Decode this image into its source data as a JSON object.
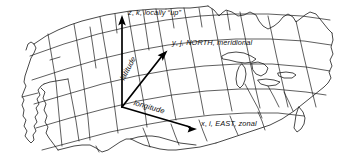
{
  "figure": {
    "background_color": "#ffffff",
    "line_color": "#1a1a1a",
    "axis_color": "#000000",
    "width": 343,
    "height": 162
  },
  "map": {
    "name": "continental-united-states",
    "projection": "oblique perspective",
    "features": [
      "state-boundaries",
      "coastline",
      "great-lakes",
      "graticule"
    ]
  },
  "axes": {
    "origin": {
      "x": 122,
      "y": 107
    },
    "items": [
      {
        "name": "z-axis",
        "label_parts": {
          "symbol": "z",
          "unit_vector": "k",
          "rest": ", locally “up”"
        },
        "full_label": "z, k, locally “up”",
        "tip": {
          "x": 122,
          "y": 17
        }
      },
      {
        "name": "y-axis",
        "label_parts": {
          "symbol": "y",
          "unit_vector": "j",
          "rest": ", NORTH, meridional"
        },
        "full_label": "y, j, NORTH, meridional",
        "tip": {
          "x": 166,
          "y": 52
        }
      },
      {
        "name": "x-axis",
        "label_parts": {
          "symbol": "x",
          "unit_vector": "i",
          "rest": ", EAST, zonal"
        },
        "full_label": "x, i, EAST, zonal",
        "tip": {
          "x": 197,
          "y": 128
        }
      }
    ]
  },
  "curve_labels": [
    {
      "name": "latitude",
      "text": "latitude",
      "rotation_deg": -62
    },
    {
      "name": "longitude",
      "text": "longitude",
      "rotation_deg": 16
    }
  ]
}
